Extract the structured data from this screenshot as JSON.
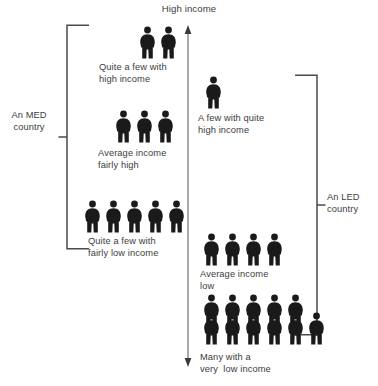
{
  "diagram": {
    "title_top": "High income",
    "axis": {
      "name": "income-axis",
      "top_arrow": "up",
      "bottom_arrow": "down",
      "top_label": "High income"
    },
    "brackets": [
      {
        "id": "med",
        "label_line1": "An MED",
        "label_line2": "country",
        "side": "left"
      },
      {
        "id": "led",
        "label_line1": "An LED",
        "label_line2": "country",
        "side": "right"
      }
    ],
    "groups": [
      {
        "id": "med-high",
        "side": "left",
        "count": 2,
        "rows": [
          2
        ],
        "caption_line1": "Quite a few with",
        "caption_line2": "high income"
      },
      {
        "id": "med-average",
        "side": "left",
        "count": 3,
        "rows": [
          3
        ],
        "caption_line1": "Average income",
        "caption_line2": "fairly high"
      },
      {
        "id": "med-low",
        "side": "left",
        "count": 5,
        "rows": [
          5
        ],
        "caption_line1": "Quite a few with",
        "caption_line2": "fairly low income"
      },
      {
        "id": "led-high",
        "side": "right",
        "count": 1,
        "rows": [
          1
        ],
        "caption_line1": "A few with quite",
        "caption_line2": "high income"
      },
      {
        "id": "led-average",
        "side": "right",
        "count": 4,
        "rows": [
          4
        ],
        "caption_line1": "Average income",
        "caption_line2": "low"
      },
      {
        "id": "led-many",
        "side": "right",
        "count": 10,
        "rows": [
          5,
          5
        ],
        "caption_line1": "Many with a",
        "caption_line2": "very  low income"
      }
    ],
    "colors": {
      "figure": "#1a1a1a",
      "line": "#4a4a4a",
      "text": "#3d3d3d",
      "background": "#ffffff"
    }
  }
}
